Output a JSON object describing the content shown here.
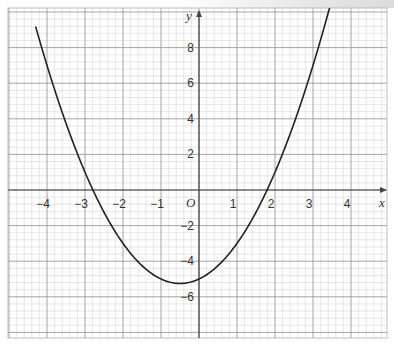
{
  "chart_data": {
    "type": "line",
    "title": "",
    "xlabel": "x",
    "ylabel": "y",
    "origin_label": "O",
    "equation_estimate": "y = x^2 + x - 5",
    "xlim": [
      -5,
      5
    ],
    "ylim": [
      -8,
      10
    ],
    "x_ticks": [
      "-4",
      "-3",
      "-2",
      "-1",
      "1",
      "2",
      "3",
      "4"
    ],
    "y_ticks": [
      "8",
      "6",
      "4",
      "2",
      "-2",
      "-4",
      "-6"
    ],
    "grid": true,
    "minor_grid_step": 0.2,
    "series": [
      {
        "name": "curve",
        "x": [
          -4.3,
          -4,
          -3.5,
          -3,
          -2.79,
          -2.5,
          -2,
          -1.5,
          -1,
          -0.5,
          0,
          0.5,
          1,
          1.5,
          1.79,
          2,
          2.5,
          3,
          3.45
        ],
        "y": [
          9.19,
          7,
          3.75,
          1,
          0,
          -1.25,
          -3,
          -4.25,
          -5,
          -5.25,
          -5,
          -4.25,
          -3,
          -1.25,
          0,
          1,
          3.75,
          7,
          10.35
        ]
      }
    ],
    "key_points": {
      "x_intercepts": [
        -2.8,
        1.8
      ],
      "y_intercept": -5,
      "minimum": [
        -0.5,
        -5.25
      ]
    }
  }
}
